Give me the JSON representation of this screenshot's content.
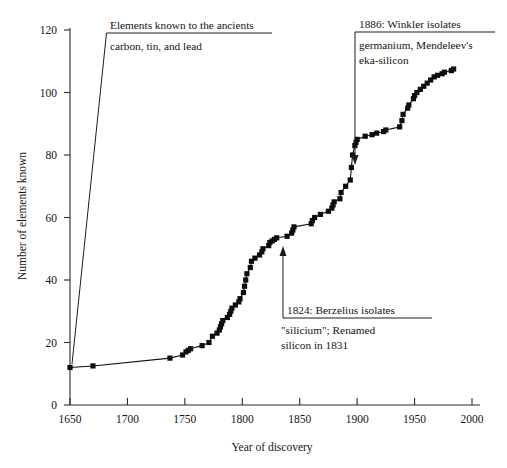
{
  "chart_data": {
    "type": "line",
    "title": "",
    "xlabel": "Year of discovery",
    "ylabel": "Number of elements known",
    "xlim": [
      1650,
      2000
    ],
    "ylim": [
      0,
      120
    ],
    "xticks": [
      1650,
      1700,
      1750,
      1800,
      1850,
      1900,
      1950,
      2000
    ],
    "yticks": [
      0,
      20,
      40,
      60,
      80,
      100,
      120
    ],
    "grid": false,
    "legend": "none",
    "series": [
      {
        "name": "Cumulative elements known",
        "marker": "square",
        "color": "#0d0d0d",
        "points": [
          [
            1650,
            12
          ],
          [
            1670,
            12.5
          ],
          [
            1737,
            15
          ],
          [
            1748,
            16
          ],
          [
            1751,
            17
          ],
          [
            1753,
            17.5
          ],
          [
            1755,
            18
          ],
          [
            1765,
            19
          ],
          [
            1771,
            20
          ],
          [
            1774,
            22
          ],
          [
            1778,
            23
          ],
          [
            1780,
            24
          ],
          [
            1781,
            25
          ],
          [
            1782,
            26
          ],
          [
            1783,
            27
          ],
          [
            1787,
            28
          ],
          [
            1789,
            29
          ],
          [
            1790,
            30
          ],
          [
            1791,
            31
          ],
          [
            1794,
            32
          ],
          [
            1797,
            33
          ],
          [
            1798,
            34
          ],
          [
            1801,
            36
          ],
          [
            1802,
            38
          ],
          [
            1803,
            40
          ],
          [
            1804,
            42
          ],
          [
            1807,
            44
          ],
          [
            1808,
            46
          ],
          [
            1811,
            47
          ],
          [
            1815,
            48
          ],
          [
            1817,
            49
          ],
          [
            1818,
            50
          ],
          [
            1823,
            51
          ],
          [
            1824,
            52
          ],
          [
            1826,
            52.5
          ],
          [
            1828,
            53
          ],
          [
            1830,
            53.5
          ],
          [
            1839,
            54
          ],
          [
            1843,
            55
          ],
          [
            1844,
            56
          ],
          [
            1845,
            57
          ],
          [
            1860,
            58
          ],
          [
            1861,
            59
          ],
          [
            1863,
            60
          ],
          [
            1868,
            61
          ],
          [
            1875,
            62
          ],
          [
            1878,
            63
          ],
          [
            1879,
            64
          ],
          [
            1880,
            65
          ],
          [
            1885,
            66
          ],
          [
            1886,
            68
          ],
          [
            1890,
            70
          ],
          [
            1894,
            72
          ],
          [
            1895,
            76
          ],
          [
            1896,
            80
          ],
          [
            1898,
            83
          ],
          [
            1899,
            84
          ],
          [
            1900,
            85
          ],
          [
            1907,
            86
          ],
          [
            1913,
            86.5
          ],
          [
            1917,
            87
          ],
          [
            1923,
            87.5
          ],
          [
            1925,
            88
          ],
          [
            1937,
            89
          ],
          [
            1939,
            91
          ],
          [
            1940,
            93
          ],
          [
            1944,
            95
          ],
          [
            1945,
            96
          ],
          [
            1949,
            98
          ],
          [
            1950,
            99
          ],
          [
            1952,
            100
          ],
          [
            1955,
            101
          ],
          [
            1958,
            102
          ],
          [
            1961,
            103
          ],
          [
            1964,
            104
          ],
          [
            1967,
            105
          ],
          [
            1970,
            105.5
          ],
          [
            1974,
            106
          ],
          [
            1976,
            106.5
          ],
          [
            1982,
            107
          ],
          [
            1984,
            107.5
          ]
        ]
      }
    ],
    "annotations": [
      {
        "id": "ancients",
        "heading": "Elements known to the ancients",
        "body_lines": [
          "carbon, tin, and lead"
        ],
        "target_year": 1650,
        "target_value": 12
      },
      {
        "id": "berzelius",
        "heading": "1824: Berzelius isolates",
        "body_lines": [
          "\"silicium\"; Renamed",
          "silicon in 1831"
        ],
        "target_year": 1824,
        "target_value": 50
      },
      {
        "id": "winkler",
        "heading": "1886: Winkler isolates",
        "body_lines": [
          "germanium, Mendeleev's",
          "eka-silicon"
        ],
        "target_year": 1886,
        "target_value": 68
      }
    ]
  }
}
